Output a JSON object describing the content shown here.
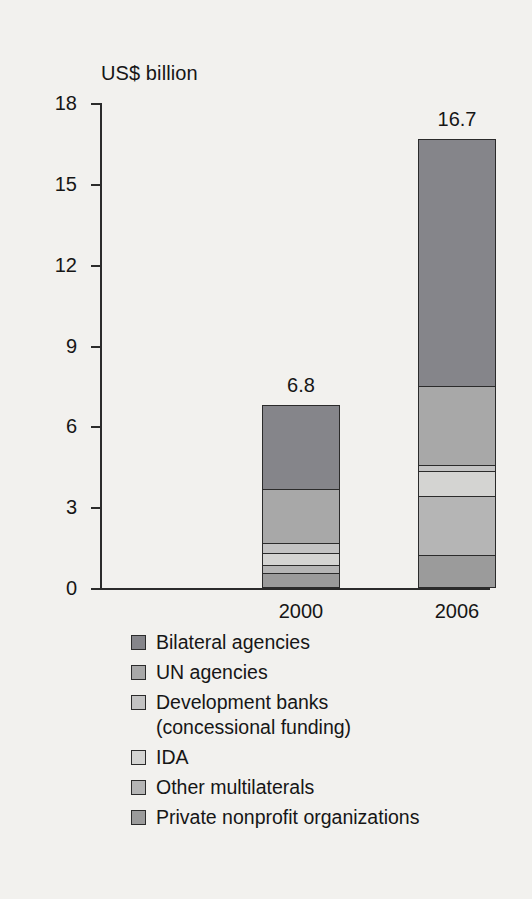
{
  "chart_data": {
    "type": "bar",
    "subtype": "stacked-bar",
    "title": "",
    "xlabel": "",
    "ylabel": "US$ billion",
    "ylim": [
      0,
      18
    ],
    "yticks": [
      0,
      3,
      6,
      9,
      12,
      15,
      18
    ],
    "ytick_labels": [
      "0",
      "3",
      "6",
      "9",
      "12",
      "15",
      "18"
    ],
    "grid": false,
    "legend_position": "bottom-left",
    "categories": [
      "2000",
      "2006"
    ],
    "totals": [
      6.8,
      16.7
    ],
    "total_labels": [
      "6.8",
      "16.7"
    ],
    "series": [
      {
        "name": "Bilateral agencies",
        "values": [
          3.15,
          9.2
        ],
        "color": "#85858a"
      },
      {
        "name": "UN agencies",
        "values": [
          2.05,
          2.95
        ],
        "color": "#a8a8a8"
      },
      {
        "name": "Development banks\n(concessional funding)",
        "values": [
          0.35,
          0.2
        ],
        "color": "#c3c3c3"
      },
      {
        "name": "IDA",
        "values": [
          0.45,
          0.95
        ],
        "color": "#d4d4d2"
      },
      {
        "name": "Other multilaterals",
        "values": [
          0.3,
          2.2
        ],
        "color": "#b5b5b5"
      },
      {
        "name": "Private nonprofit organizations",
        "values": [
          0.5,
          1.15
        ],
        "color": "#9b9b9b"
      }
    ]
  },
  "axis": {
    "y_title": "US$ billion",
    "ticks": [
      {
        "label": "18",
        "value": 18
      },
      {
        "label": "15",
        "value": 15
      },
      {
        "label": "12",
        "value": 12
      },
      {
        "label": "9",
        "value": 9
      },
      {
        "label": "6",
        "value": 6
      },
      {
        "label": "3",
        "value": 3
      },
      {
        "label": "0",
        "value": 0
      }
    ]
  },
  "bars": [
    {
      "category": "2000",
      "total_label": "6.8",
      "segments": [
        {
          "name": "Private nonprofit organizations",
          "value": 0.5,
          "color": "#9b9b9b"
        },
        {
          "name": "Other multilaterals",
          "value": 0.3,
          "color": "#b5b5b5"
        },
        {
          "name": "IDA",
          "value": 0.45,
          "color": "#d4d4d2"
        },
        {
          "name": "Development banks",
          "value": 0.35,
          "color": "#c3c3c3"
        },
        {
          "name": "UN agencies",
          "value": 2.05,
          "color": "#a8a8a8"
        },
        {
          "name": "Bilateral agencies",
          "value": 3.15,
          "color": "#85858a"
        }
      ]
    },
    {
      "category": "2006",
      "total_label": "16.7",
      "segments": [
        {
          "name": "Private nonprofit organizations",
          "value": 1.15,
          "color": "#9b9b9b"
        },
        {
          "name": "Other multilaterals",
          "value": 2.2,
          "color": "#b5b5b5"
        },
        {
          "name": "IDA",
          "value": 0.95,
          "color": "#d4d4d2"
        },
        {
          "name": "Development banks",
          "value": 0.2,
          "color": "#c3c3c3"
        },
        {
          "name": "UN agencies",
          "value": 2.95,
          "color": "#a8a8a8"
        },
        {
          "name": "Bilateral agencies",
          "value": 9.2,
          "color": "#85858a"
        }
      ]
    }
  ],
  "legend": {
    "items": [
      {
        "label": "Bilateral agencies",
        "color": "#85858a"
      },
      {
        "label": "UN agencies",
        "color": "#a8a8a8"
      },
      {
        "label": "Development banks\n(concessional funding)",
        "color": "#c3c3c3"
      },
      {
        "label": "IDA",
        "color": "#d4d4d2"
      },
      {
        "label": "Other multilaterals",
        "color": "#b5b5b5"
      },
      {
        "label": "Private nonprofit organizations",
        "color": "#9b9b9b"
      }
    ]
  },
  "colors": {
    "background": "#f2f1ee",
    "axis": "#2b2b2b",
    "text": "#161616"
  }
}
